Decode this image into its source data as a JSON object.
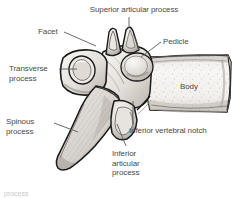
{
  "figure": {
    "illustration_type": "anatomical line drawing with stipple shading",
    "background_color": "#ffffff",
    "line_color": "#1a1a1a",
    "label_color": "#4a4a4a",
    "bone_fill_light": "#f2f0ee",
    "bone_fill_mid": "#d8d4d0",
    "bone_fill_shadow": "#a8a29c",
    "leader_color": "#5a5a5a"
  },
  "labels": {
    "superior_articular_process": "Superior articular process",
    "facet": "Facet",
    "pedicle": "Pedicle",
    "transverse_process": "Transverse\nprocess",
    "body": "Body",
    "spinous_process": "Spinous\nprocess",
    "inferior_vertebral_notch": "Inferior vertebral notch",
    "inferior_articular_process": "Inferior\narticular\nprocess"
  },
  "caption": {
    "cutoff_text": "process"
  }
}
